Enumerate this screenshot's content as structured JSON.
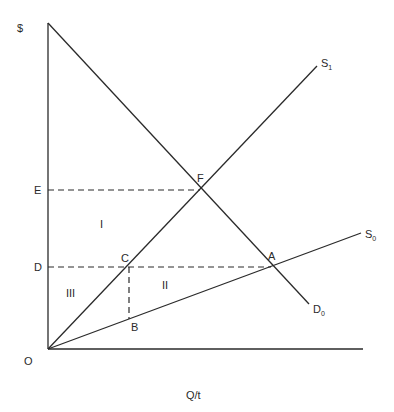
{
  "diagram": {
    "y_axis_label": "$",
    "x_axis_label": "Q/t",
    "origin_label": "O",
    "price_labels": {
      "E": "E",
      "D": "D"
    },
    "points": {
      "F": "F",
      "C": "C",
      "A": "A",
      "B": "B"
    },
    "regions": {
      "I": "I",
      "II": "II",
      "III": "III"
    },
    "curves": {
      "S1": {
        "main": "S",
        "sub": "1"
      },
      "S0": {
        "main": "S",
        "sub": "0"
      },
      "D0": {
        "main": "D",
        "sub": "0"
      }
    },
    "colors": {
      "line": "#2a2a2a",
      "background": "#ffffff"
    }
  }
}
